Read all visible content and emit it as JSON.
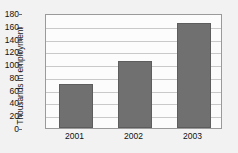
{
  "chart_data": {
    "type": "bar",
    "title": "",
    "xlabel": "",
    "ylabel": "Thousands in employment",
    "categories": [
      "2001",
      "2002",
      "2003"
    ],
    "values": [
      69,
      105,
      165
    ],
    "ylim": [
      0,
      180
    ],
    "yticks": [
      0,
      20,
      40,
      60,
      80,
      100,
      120,
      140,
      160,
      180
    ],
    "ytick_labels": [
      "0",
      "20",
      "40",
      "60",
      "80",
      "100",
      "120",
      "140",
      "160",
      "180"
    ],
    "grid": true,
    "legend": false,
    "legend_position": "none",
    "series": [
      {
        "name": "Employment",
        "values": [
          69,
          105,
          165
        ]
      }
    ],
    "colors": {
      "bar_fill": "#707070",
      "bar_edge": "#5d5d5d",
      "plot_background": "#fcfcfc",
      "figure_background": "#f2f2f2",
      "gridline": "#c9c9c9",
      "axis_line": "#9a9a9a",
      "text": "#111111"
    }
  }
}
